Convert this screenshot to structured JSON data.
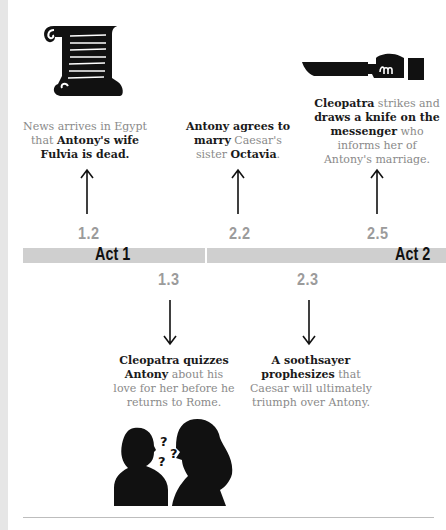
{
  "timeline": {
    "acts": [
      {
        "label": "Act 1"
      },
      {
        "label": "Act 2"
      }
    ],
    "events_above": [
      {
        "scene": "1.2",
        "icon": "scroll-icon",
        "caption_parts": [
          {
            "text": "News arrives in Egypt that ",
            "bold": false
          },
          {
            "text": "Antony's wife Fulvia is dead.",
            "bold": true
          }
        ]
      },
      {
        "scene": "2.2",
        "icon": null,
        "caption_parts": [
          {
            "text": "Antony agrees to marry",
            "bold": true
          },
          {
            "text": " Caesar's sister ",
            "bold": false
          },
          {
            "text": "Octavia",
            "bold": true
          },
          {
            "text": ".",
            "bold": false
          }
        ]
      },
      {
        "scene": "2.5",
        "icon": "knife-icon",
        "caption_parts": [
          {
            "text": "Cleopatra",
            "bold": true
          },
          {
            "text": " strikes and ",
            "bold": false
          },
          {
            "text": "draws a knife on the messenger",
            "bold": true
          },
          {
            "text": " who informs her of Antony's marriage.",
            "bold": false
          }
        ]
      }
    ],
    "events_below": [
      {
        "scene": "1.3",
        "icon": "conversation-icon",
        "caption_parts": [
          {
            "text": "Cleopatra quizzes Antony",
            "bold": true
          },
          {
            "text": " about his love for her before he returns to Rome.",
            "bold": false
          }
        ]
      },
      {
        "scene": "2.3",
        "icon": null,
        "caption_parts": [
          {
            "text": "A soothsayer prophesizes",
            "bold": true
          },
          {
            "text": " that Caesar will ultimately triumph over Antony.",
            "bold": false
          }
        ]
      }
    ]
  },
  "colors": {
    "bar": "#cfcfcf",
    "scene_number": "#9b9b9b",
    "caption_light": "#8a8a8a",
    "caption_bold": "#1a1a1a"
  }
}
